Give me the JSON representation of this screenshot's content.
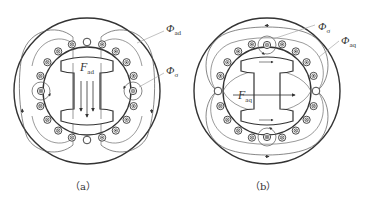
{
  "figure": {
    "panels": [
      {
        "id": "a",
        "caption": "（a）",
        "labels": {
          "flux_armature": {
            "symbol": "Φ",
            "sub": "ad"
          },
          "flux_leakage": {
            "symbol": "Φ",
            "sub": "σ"
          },
          "mmf": {
            "symbol": "F",
            "sub": "ad"
          }
        },
        "description": "Direct-axis armature reaction: I-shaped rotor, stator coils with ⊗ on left and ⊙ on right, flux lines vertical through rotor pole"
      },
      {
        "id": "b",
        "caption": "（b）",
        "labels": {
          "flux_leakage": {
            "symbol": "Φ",
            "sub": "σ"
          },
          "flux_armature": {
            "symbol": "Φ",
            "sub": "aq"
          },
          "mmf": {
            "symbol": "F",
            "sub": "aq"
          }
        },
        "description": "Quadrature-axis armature reaction: I-shaped rotor, stator coils with ⊙ on top and ⊗ on bottom, flux lines horizontal across rotor"
      }
    ],
    "colors": {
      "stroke": "#333333",
      "thin_stroke": "#555555",
      "leader": "#999999",
      "background": "#ffffff"
    }
  }
}
